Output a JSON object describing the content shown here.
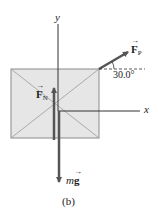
{
  "figure": {
    "caption": "(b)",
    "axes": {
      "x_label": "x",
      "y_label": "y"
    },
    "box": {
      "fill": "#e6e6e6",
      "stroke": "#8a8a8a"
    },
    "forces": [
      {
        "id": "normal",
        "symbol": "F",
        "subscript": "N",
        "direction": "up"
      },
      {
        "id": "pull",
        "symbol": "F",
        "subscript": "P",
        "direction": "up-right",
        "angle": "30.0°"
      },
      {
        "id": "weight",
        "prefix": "m",
        "symbol": "g",
        "direction": "down"
      }
    ],
    "arrow_color": "#555555"
  }
}
